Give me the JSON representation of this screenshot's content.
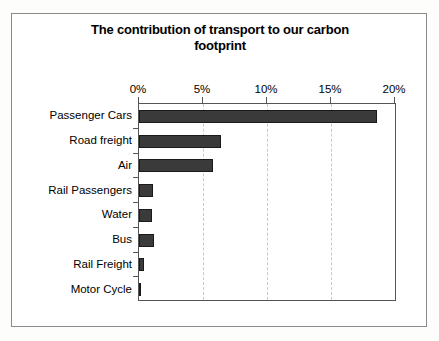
{
  "chart_data": {
    "type": "bar",
    "orientation": "horizontal",
    "title": "The contribution of transport to our carbon footprint",
    "title_line1": "The contribution of transport to our carbon",
    "title_line2": "footprint",
    "xlabel": "",
    "ylabel": "",
    "categories": [
      "Passenger Cars",
      "Road freight",
      "Air",
      "Rail Passengers",
      "Water",
      "Bus",
      "Rail Freight",
      "Motor Cycle"
    ],
    "values": [
      18.6,
      6.4,
      5.8,
      1.1,
      1.0,
      1.2,
      0.4,
      0.1
    ],
    "xlim": [
      0,
      20
    ],
    "xticks": [
      0,
      5,
      10,
      15,
      20
    ],
    "xtick_labels": [
      "0%",
      "5%",
      "10%",
      "15%",
      "20%"
    ],
    "grid": "vertical-dashed",
    "legend": "none",
    "bar_color": "#3a3a3a",
    "bar_edge_color": "#1a1a1a",
    "plot_background": "#ffffff",
    "frame_color": "#8a8a8a"
  }
}
